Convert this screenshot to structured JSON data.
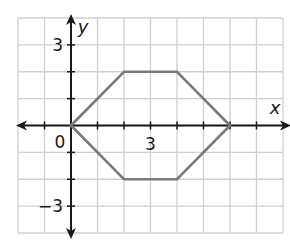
{
  "chart_data": {
    "type": "line",
    "title": "",
    "xlabel": "x",
    "ylabel": "y",
    "xlim": [
      -2,
      8
    ],
    "ylim": [
      -4,
      4
    ],
    "grid": true,
    "x_tick_labels": [
      {
        "value": 3,
        "label": "3"
      }
    ],
    "y_tick_labels": [
      {
        "value": 3,
        "label": "3"
      },
      {
        "value": -3,
        "label": "−3"
      }
    ],
    "origin_label": "0",
    "series": [
      {
        "name": "hexagon",
        "closed": true,
        "color": "#7a7a7a",
        "points": [
          [
            0,
            0
          ],
          [
            2,
            2
          ],
          [
            4,
            2
          ],
          [
            6,
            0
          ],
          [
            4,
            -2
          ],
          [
            2,
            -2
          ]
        ]
      }
    ]
  },
  "colors": {
    "grid": "#d0d0d0",
    "axis": "#1a1a1a",
    "shape": "#7a7a7a"
  }
}
